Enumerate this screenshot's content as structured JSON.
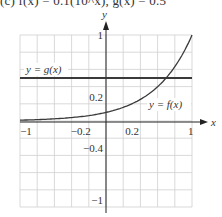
{
  "caption": "(c)   f(x) = 0.1(10^x), g(x) = 0.5",
  "chart_data": {
    "type": "line",
    "title": "f(x) = 0.1(10^x), g(x) = 0.5",
    "xlabel": "x",
    "ylabel": "y",
    "xlim": [
      -1,
      1
    ],
    "ylim": [
      -1,
      1
    ],
    "grid": true,
    "grid_step": 0.2,
    "x_tick_labels": [
      {
        "value": -1,
        "label": "−1"
      },
      {
        "value": -0.2,
        "label": "−0.2"
      },
      {
        "value": 0.2,
        "label": "0.2"
      },
      {
        "value": 1,
        "label": "1"
      }
    ],
    "y_tick_labels": [
      {
        "value": 1,
        "label": "1"
      },
      {
        "value": 0.2,
        "label": "0.2"
      },
      {
        "value": -0.4,
        "label": "−0.4"
      },
      {
        "value": -1,
        "label": "−1"
      }
    ],
    "series": [
      {
        "name": "f",
        "label": "y = f(x)",
        "formula": "0.1*10^x",
        "x": [
          -1,
          -0.8,
          -0.6,
          -0.4,
          -0.2,
          0,
          0.2,
          0.4,
          0.6,
          0.7,
          0.8,
          1
        ],
        "y": [
          0.01,
          0.016,
          0.025,
          0.04,
          0.063,
          0.1,
          0.158,
          0.251,
          0.398,
          0.5,
          0.631,
          1.0
        ],
        "label_pos": {
          "x": 0.5,
          "y": 0.15
        }
      },
      {
        "name": "g",
        "label": "y = g(x)",
        "formula": "0.5",
        "x": [
          -1,
          1
        ],
        "y": [
          0.5,
          0.5
        ],
        "label_pos": {
          "x": -0.93,
          "y": 0.56
        }
      }
    ],
    "colors": {
      "curve": "#3a3a3a",
      "grid": "#cfcfcf",
      "axis": "#222222"
    }
  }
}
